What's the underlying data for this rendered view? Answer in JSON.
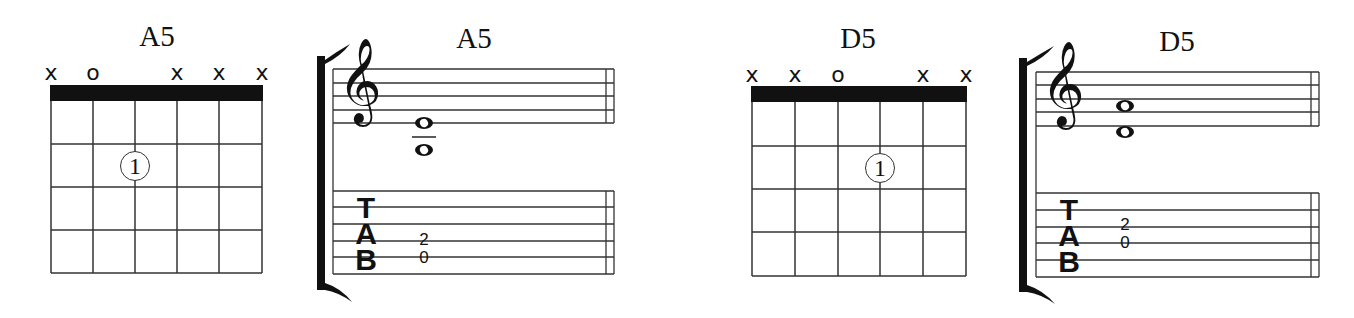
{
  "chords": [
    {
      "name": "A5",
      "chord_title": "A5",
      "staff_title": "A5",
      "string_marks": [
        "x",
        "o",
        "",
        "x",
        "x",
        "x"
      ],
      "finger_positions": [
        {
          "string": 4,
          "fret": 2,
          "finger": "1"
        }
      ],
      "standard_notation": {
        "clef": "treble",
        "notes": [
          "E4",
          "A3"
        ]
      },
      "tab": {
        "header": [
          "T",
          "A",
          "B"
        ],
        "frets": [
          {
            "string": 4,
            "fret": "2"
          },
          {
            "string": 5,
            "fret": "0"
          }
        ]
      }
    },
    {
      "name": "D5",
      "chord_title": "D5",
      "staff_title": "D5",
      "string_marks": [
        "x",
        "x",
        "o",
        "",
        "x",
        "x"
      ],
      "finger_positions": [
        {
          "string": 3,
          "fret": 2,
          "finger": "1"
        }
      ],
      "standard_notation": {
        "clef": "treble",
        "notes": [
          "A4",
          "D4"
        ]
      },
      "tab": {
        "header": [
          "T",
          "A",
          "B"
        ],
        "frets": [
          {
            "string": 3,
            "fret": "2"
          },
          {
            "string": 4,
            "fret": "0"
          }
        ]
      }
    }
  ],
  "labels": {
    "a5_title": "A5",
    "a5_staff_title": "A5",
    "a5_marks": [
      "x",
      "o",
      "x",
      "x",
      "x"
    ],
    "a5_finger": "1",
    "a5_tab_top": "2",
    "a5_tab_bottom": "0",
    "d5_title": "D5",
    "d5_staff_title": "D5",
    "d5_marks": [
      "x",
      "x",
      "o",
      "x",
      "x"
    ],
    "d5_finger": "1",
    "d5_tab_top": "2",
    "d5_tab_bottom": "0",
    "tab_t": "T",
    "tab_a": "A",
    "tab_b": "B",
    "clef_glyph": "𝄞"
  },
  "colors": {
    "ink": "#111111",
    "grid": "#333333",
    "background": "#ffffff"
  }
}
